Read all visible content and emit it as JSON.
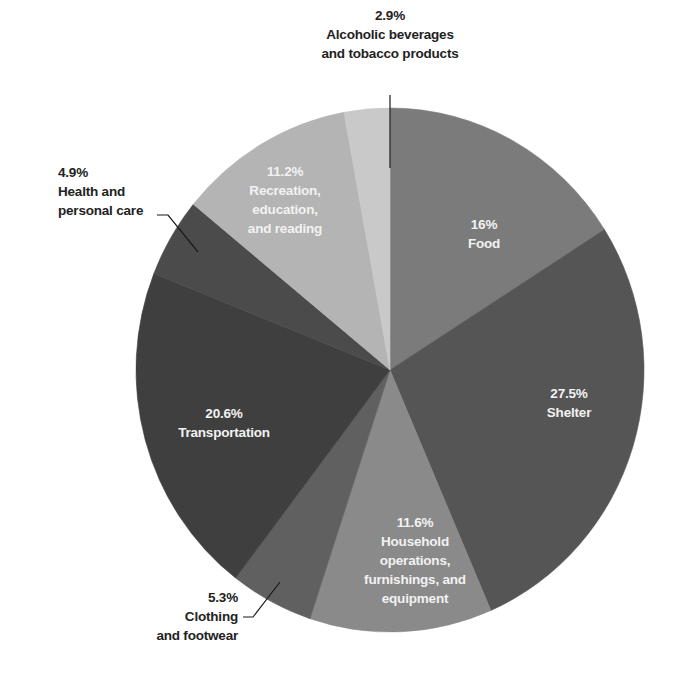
{
  "chart_data": {
    "type": "pie",
    "title": "",
    "start_angle": "12 o'clock",
    "direction": "clockwise",
    "slices": [
      {
        "category": "Food",
        "value": 16.0,
        "pct_label": "16%",
        "label_lines": [
          "Food"
        ],
        "color": "#7b7b7b",
        "label_position": "inside"
      },
      {
        "category": "Shelter",
        "value": 27.5,
        "pct_label": "27.5%",
        "label_lines": [
          "Shelter"
        ],
        "color": "#555555",
        "label_position": "inside"
      },
      {
        "category": "Household operations, furnishings, and equipment",
        "value": 11.6,
        "pct_label": "11.6%",
        "label_lines": [
          "Household",
          "operations,",
          "furnishings, and",
          "equipment"
        ],
        "color": "#8a8a8a",
        "label_position": "inside"
      },
      {
        "category": "Clothing and footwear",
        "value": 5.3,
        "pct_label": "5.3%",
        "label_lines": [
          "Clothing",
          "and footwear"
        ],
        "color": "#606060",
        "label_position": "outside"
      },
      {
        "category": "Transportation",
        "value": 20.6,
        "pct_label": "20.6%",
        "label_lines": [
          "Transportation"
        ],
        "color": "#3f3f3f",
        "label_position": "inside"
      },
      {
        "category": "Health and personal care",
        "value": 4.9,
        "pct_label": "4.9%",
        "label_lines": [
          "Health and",
          "personal care"
        ],
        "color": "#4b4b4b",
        "label_position": "outside"
      },
      {
        "category": "Recreation, education, and reading",
        "value": 11.2,
        "pct_label": "11.2%",
        "label_lines": [
          "Recreation,",
          "education,",
          "and reading"
        ],
        "color": "#b4b4b4",
        "label_position": "inside"
      },
      {
        "category": "Alcoholic beverages and tobacco products",
        "value": 2.9,
        "pct_label": "2.9%",
        "label_lines": [
          "Alcoholic beverages",
          "and tobacco products"
        ],
        "color": "#c9c9c9",
        "label_position": "outside"
      }
    ],
    "categories": [
      "Food",
      "Shelter",
      "Household operations, furnishings, and equipment",
      "Clothing and footwear",
      "Transportation",
      "Health and personal care",
      "Recreation, education, and reading",
      "Alcoholic beverages and tobacco products"
    ],
    "values": [
      16.0,
      27.5,
      11.6,
      5.3,
      20.6,
      4.9,
      11.2,
      2.9
    ],
    "legend": "none (direct labels)",
    "grid": false
  },
  "labels": {
    "food": {
      "pct": "16%",
      "l1": "Food"
    },
    "shelter": {
      "pct": "27.5%",
      "l1": "Shelter"
    },
    "household": {
      "pct": "11.6%",
      "l1": "Household",
      "l2": "operations,",
      "l3": "furnishings, and",
      "l4": "equipment"
    },
    "clothing": {
      "pct": "5.3%",
      "l1": "Clothing",
      "l2": "and footwear"
    },
    "transportation": {
      "pct": "20.6%",
      "l1": "Transportation"
    },
    "health": {
      "pct": "4.9%",
      "l1": "Health and",
      "l2": "personal care"
    },
    "recreation": {
      "pct": "11.2%",
      "l1": "Recreation,",
      "l2": "education,",
      "l3": "and reading"
    },
    "alcohol": {
      "pct": "2.9%",
      "l1": "Alcoholic beverages",
      "l2": "and tobacco products"
    }
  }
}
